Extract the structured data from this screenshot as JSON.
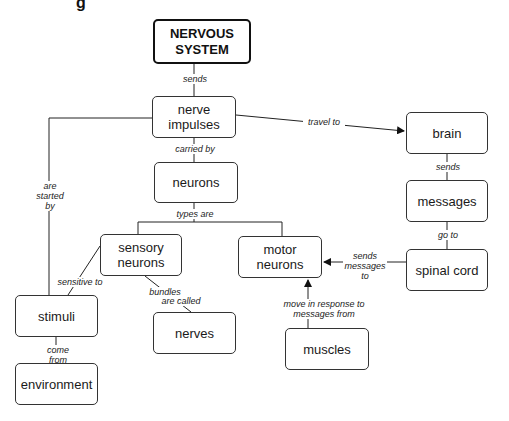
{
  "header": {
    "clipped_title_fragment": "g"
  },
  "nodes": {
    "nervous_system": "NERVOUS\nSYSTEM",
    "nerve_impulses": "nerve\nimpulses",
    "neurons": "neurons",
    "sensory_neurons": "sensory\nneurons",
    "motor_neurons": "motor\nneurons",
    "brain": "brain",
    "messages": "messages",
    "spinal_cord": "spinal cord",
    "stimuli": "stimuli",
    "nerves": "nerves",
    "muscles": "muscles",
    "environment": "environment"
  },
  "links": {
    "sends_1": "sends",
    "travel_to": "travel to",
    "carried_by": "carried by",
    "are_started_by": "are\nstarted\nby",
    "types_are": "types are",
    "sends_2": "sends",
    "go_to": "go to",
    "sends_messages_to": "sends\nmessages\nto",
    "sensitive_to": "sensitive to",
    "bundles_are_called_1": "bundles",
    "bundles_are_called_2": "are called",
    "move_in_response": "move in response to\nmessages from",
    "come_from": "come from"
  }
}
